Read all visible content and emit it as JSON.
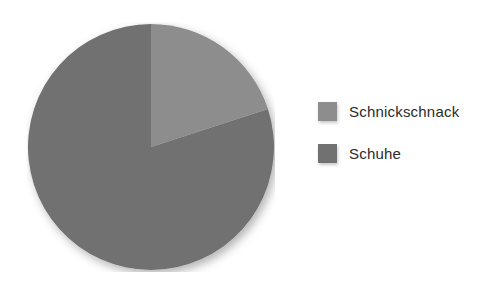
{
  "chart_data": {
    "type": "pie",
    "title": "",
    "categories": [
      "Schnickschnack",
      "Schuhe"
    ],
    "values": [
      20,
      80
    ],
    "unit": "percent",
    "start_angle_deg": 0,
    "direction": "clockwise",
    "legend_position": "right",
    "grid": false,
    "slices": [
      {
        "label": "Schnickschnack",
        "value": 20,
        "color": "#8d8d8d",
        "start_deg": 0,
        "end_deg": 72
      },
      {
        "label": "Schuhe",
        "value": 80,
        "color": "#717171",
        "start_deg": 72,
        "end_deg": 360
      }
    ]
  },
  "legend": {
    "items": [
      {
        "label": "Schnickschnack",
        "color": "#8d8d8d",
        "swatch_name": "legend-swatch-schnickschnack"
      },
      {
        "label": "Schuhe",
        "color": "#717171",
        "swatch_name": "legend-swatch-schuhe"
      }
    ]
  },
  "colors": {
    "background": "#ffffff",
    "slice_light": "#8d8d8d",
    "slice_dark": "#717171",
    "text": "#2b2b2b"
  }
}
